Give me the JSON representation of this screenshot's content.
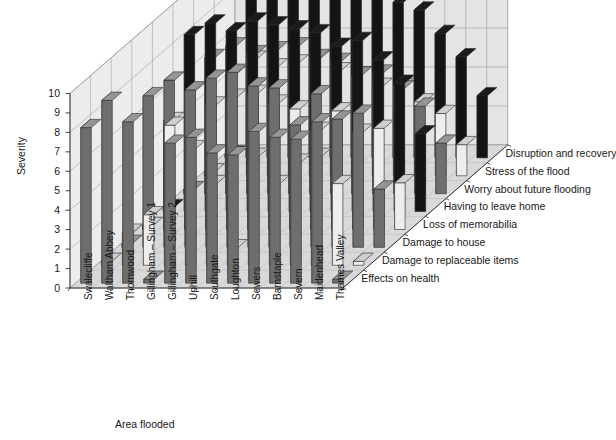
{
  "chart_data": {
    "type": "bar",
    "subtype": "3d-grouped-bar",
    "title": "",
    "xlabel": "Area flooded",
    "ylabel": "Severity",
    "zlabel": "",
    "ylim": [
      0,
      10
    ],
    "yticks": [
      0,
      1,
      2,
      3,
      4,
      5,
      6,
      7,
      8,
      9,
      10
    ],
    "grid": true,
    "legend_position": "right-inline-axis",
    "categories": [
      "Swalecliffe",
      "Waltham Abbey",
      "Thornwood",
      "Gillingham – Survey 1",
      "Gillingham – Survey 2",
      "Uphill",
      "Southgate",
      "Loughton",
      "Sewers",
      "Barnstaple",
      "Severn",
      "Maidenhead",
      "Thames Valley"
    ],
    "series": [
      {
        "name": "Effects on health",
        "color": "#6e6e6e",
        "values": [
          8.0,
          9.4,
          8.3,
          0.2,
          7.2,
          7.5,
          6.7,
          6.6,
          7.8,
          7.5,
          7.4,
          8.3,
          0.2
        ]
      },
      {
        "name": "Damage to replaceable items",
        "color": "#ededed",
        "values": [
          0.2,
          1.7,
          2.6,
          7.2,
          6.0,
          4.2,
          0.9,
          5.6,
          4.2,
          5.3,
          5.6,
          4.2,
          0.2
        ]
      },
      {
        "name": "Damage to house",
        "color": "#6e6e6e",
        "values": [
          0.2,
          7.8,
          8.6,
          8.1,
          8.7,
          9.0,
          8.3,
          8.2,
          6.3,
          7.9,
          6.6,
          6.9,
          3.0
        ]
      },
      {
        "name": "Loss of memorabilia",
        "color": "#ededed",
        "values": [
          0.2,
          5.6,
          7.1,
          6.4,
          6.8,
          7.0,
          6.5,
          6.2,
          5.1,
          6.1,
          5.0,
          5.2,
          2.4
        ]
      },
      {
        "name": "Having to leave home",
        "color": "#141414",
        "values": [
          0.2,
          9.1,
          9.7,
          9.3,
          9.8,
          9.6,
          9.4,
          9.2,
          8.5,
          8.8,
          7.8,
          6.6,
          4.0
        ]
      },
      {
        "name": "Worry about future flooding",
        "color": "#6e6e6e",
        "values": [
          0.2,
          7.0,
          7.6,
          7.2,
          7.4,
          7.6,
          7.0,
          6.8,
          6.1,
          6.2,
          5.4,
          4.5,
          2.6
        ]
      },
      {
        "name": "Stress of the flood",
        "color": "#ededed",
        "values": [
          0.2,
          5.2,
          6.0,
          5.6,
          5.8,
          6.0,
          5.4,
          5.2,
          4.6,
          4.6,
          3.8,
          3.2,
          1.6
        ]
      },
      {
        "name": "Disruption and recovery",
        "color": "#141414",
        "values": [
          0.2,
          8.6,
          9.4,
          9.0,
          9.5,
          9.3,
          9.1,
          8.7,
          8.0,
          7.6,
          6.4,
          5.2,
          3.2
        ]
      }
    ],
    "colors": {
      "bar_gray": "#6e6e6e",
      "bar_light": "#ededed",
      "bar_black": "#141414",
      "wall": "#e4e4e4",
      "floor": "#d9d9d9",
      "grid_line": "#9a9a9a",
      "outline": "#2b2b2b",
      "background": "#ffffff"
    }
  }
}
